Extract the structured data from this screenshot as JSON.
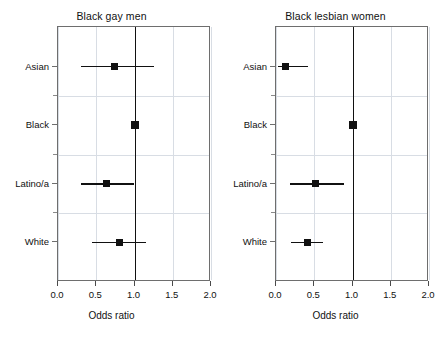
{
  "figure": {
    "background": "#ffffff",
    "marker_color": "#111111",
    "grid_color": "#d8dde4",
    "frame_color": "#6e6e6e"
  },
  "chart_data": [
    {
      "type": "scatter",
      "plot_kind": "forest-plot",
      "title": "Black gay men",
      "xlabel": "Odds ratio",
      "ylabel": "",
      "xlim": [
        0.0,
        2.0
      ],
      "xticks": [
        0.0,
        0.5,
        1.0,
        1.5,
        2.0
      ],
      "xticklabels": [
        "0.0",
        "0.5",
        "1.0",
        "1.5",
        "2.0"
      ],
      "categories": [
        "Asian",
        "Black",
        "Latino/a",
        "White"
      ],
      "reference_line": 1.0,
      "reference_category": "Black",
      "grid": true,
      "legend": "none",
      "points": [
        {
          "category": "Asian",
          "odds_ratio": 0.74,
          "ci_low": 0.3,
          "ci_high": 1.25,
          "is_reference": false
        },
        {
          "category": "Black",
          "odds_ratio": 1.0,
          "ci_low": 1.0,
          "ci_high": 1.0,
          "is_reference": true
        },
        {
          "category": "Latino/a",
          "odds_ratio": 0.64,
          "ci_low": 0.3,
          "ci_high": 1.0,
          "is_reference": false
        },
        {
          "category": "White",
          "odds_ratio": 0.8,
          "ci_low": 0.45,
          "ci_high": 1.15,
          "is_reference": false
        }
      ]
    },
    {
      "type": "scatter",
      "plot_kind": "forest-plot",
      "title": "Black lesbian women",
      "xlabel": "Odds ratio",
      "ylabel": "",
      "xlim": [
        0.0,
        2.0
      ],
      "xticks": [
        0.0,
        0.5,
        1.0,
        1.5,
        2.0
      ],
      "xticklabels": [
        "0.0",
        "0.5",
        "1.0",
        "1.5",
        "2.0"
      ],
      "categories": [
        "Asian",
        "Black",
        "Latino/a",
        "White"
      ],
      "reference_line": 1.0,
      "reference_category": "Black",
      "grid": true,
      "legend": "none",
      "points": [
        {
          "category": "Asian",
          "odds_ratio": 0.12,
          "ci_low": 0.03,
          "ci_high": 0.42,
          "is_reference": false
        },
        {
          "category": "Black",
          "odds_ratio": 1.0,
          "ci_low": 1.0,
          "ci_high": 1.0,
          "is_reference": true
        },
        {
          "category": "Latino/a",
          "odds_ratio": 0.52,
          "ci_low": 0.18,
          "ci_high": 0.89,
          "is_reference": false
        },
        {
          "category": "White",
          "odds_ratio": 0.41,
          "ci_low": 0.2,
          "ci_high": 0.62,
          "is_reference": false
        }
      ]
    }
  ]
}
